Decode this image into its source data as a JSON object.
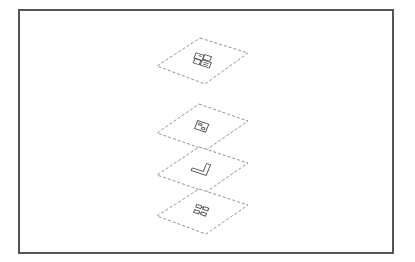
{
  "diagram": {
    "type": "exploded-isometric-layer-stack",
    "frame": {
      "x": 18,
      "y": 9,
      "width": 374,
      "height": 243,
      "stroke": "#555555"
    },
    "line_color": "#777777",
    "glyph_color": "#555555",
    "layers": [
      {
        "name": "layer-1",
        "glyph": "component-cluster",
        "outline": [
          [
            200,
            38
          ],
          [
            248,
            53
          ],
          [
            205,
            84
          ],
          [
            157,
            66
          ]
        ],
        "center": [
          203,
          61
        ]
      },
      {
        "name": "layer-2",
        "glyph": "square-pad",
        "outline": [
          [
            199,
            104
          ],
          [
            248,
            121
          ],
          [
            206,
            150
          ],
          [
            157,
            133
          ]
        ],
        "center": [
          202,
          127
        ]
      },
      {
        "name": "layer-3",
        "glyph": "l-bracket-trace",
        "outline": [
          [
            199,
            147
          ],
          [
            248,
            163
          ],
          [
            206,
            192
          ],
          [
            157,
            175
          ]
        ],
        "center": [
          202,
          169
        ]
      },
      {
        "name": "layer-4",
        "glyph": "twin-pad-pair",
        "outline": [
          [
            199,
            189
          ],
          [
            248,
            205
          ],
          [
            206,
            234
          ],
          [
            157,
            216
          ]
        ],
        "center": [
          202,
          211
        ]
      }
    ]
  }
}
